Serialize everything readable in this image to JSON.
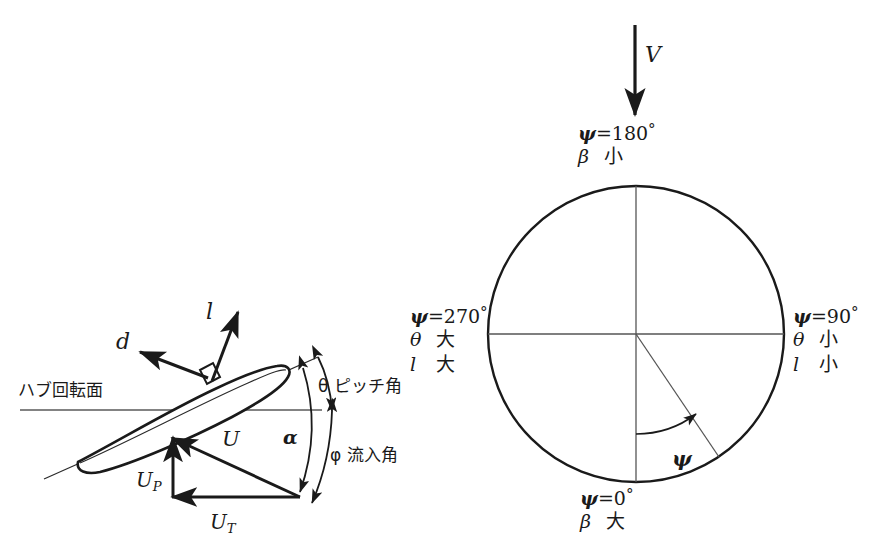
{
  "blade_section": {
    "hub_plane_label": "ハブ回転面",
    "drag_label": "d",
    "lift_label": "l",
    "pitch_angle_label": "θ ピッチ角",
    "inflow_angle_label": "φ 流入角",
    "alpha_label": "α",
    "resultant_velocity_label": "U",
    "perpendicular_velocity_label": "U",
    "perpendicular_velocity_sub": "P",
    "tangential_velocity_label": "U",
    "tangential_velocity_sub": "T"
  },
  "rotor_disk": {
    "freestream_label": "V",
    "azimuth_arc_label": "ψ",
    "stations": [
      {
        "id": "azimuth-180",
        "equation_symbol": "ψ",
        "equation_eq": "=",
        "equation_value": "180",
        "equation_unit": "°",
        "rows": [
          {
            "key": "β",
            "value": "小"
          }
        ]
      },
      {
        "id": "azimuth-90",
        "equation_symbol": "ψ",
        "equation_eq": "=",
        "equation_value": "90",
        "equation_unit": "°",
        "rows": [
          {
            "key": "θ",
            "value": "小"
          },
          {
            "key": "l",
            "value": "小"
          }
        ]
      },
      {
        "id": "azimuth-0",
        "equation_symbol": "ψ",
        "equation_eq": "=",
        "equation_value": "0",
        "equation_unit": "°",
        "rows": [
          {
            "key": "β",
            "value": "大"
          }
        ]
      },
      {
        "id": "azimuth-270",
        "equation_symbol": "ψ",
        "equation_eq": "=",
        "equation_value": "270",
        "equation_unit": "°",
        "rows": [
          {
            "key": "θ",
            "value": "大"
          },
          {
            "key": "l",
            "value": "大"
          }
        ]
      }
    ]
  },
  "colors": {
    "ink": "#1a1a1a",
    "thin_line": "#555555",
    "background": "#ffffff"
  },
  "geometry": {
    "disk_center_x": 636,
    "disk_center_y": 334,
    "disk_radius": 148,
    "azimuth_line_degrees": 34
  }
}
